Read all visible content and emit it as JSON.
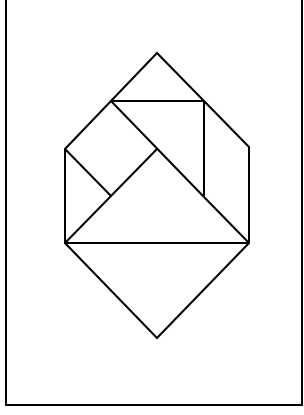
{
  "figure": {
    "stroke_color": "#000000",
    "background": "#ffffff",
    "frame": {
      "x1": 6,
      "y1": 0,
      "x2": 302,
      "y2": 405
    },
    "outline": [
      [
        157,
        53
      ],
      [
        249,
        147
      ],
      [
        249,
        243
      ],
      [
        157,
        338
      ],
      [
        65,
        243
      ],
      [
        65,
        149
      ]
    ],
    "segments": [
      {
        "name": "top-triangle-base",
        "from": [
          111,
          101
        ],
        "to": [
          204,
          101
        ]
      },
      {
        "name": "right-parallelogram-inner",
        "from": [
          204,
          101
        ],
        "to": [
          204,
          197
        ]
      },
      {
        "name": "square-top-right-edge",
        "from": [
          111,
          101
        ],
        "to": [
          204,
          197
        ]
      },
      {
        "name": "square-bottom-left-edge",
        "from": [
          65,
          149
        ],
        "to": [
          111,
          196
        ]
      },
      {
        "name": "large-triangle-left-edge",
        "from": [
          65,
          243
        ],
        "to": [
          157,
          149
        ]
      },
      {
        "name": "large-triangle-right-edge",
        "from": [
          204,
          197
        ],
        "to": [
          249,
          243
        ]
      },
      {
        "name": "middle-horizontal",
        "from": [
          65,
          243
        ],
        "to": [
          249,
          243
        ]
      }
    ]
  }
}
